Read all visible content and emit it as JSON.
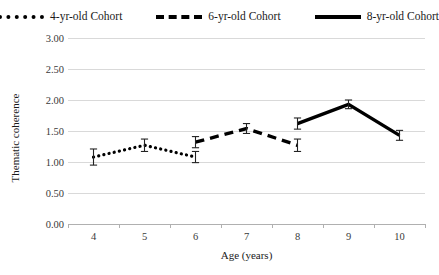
{
  "legend": {
    "entries": [
      {
        "label": "4-yr-old Cohort",
        "style": "dotted",
        "color": "#000000"
      },
      {
        "label": "6-yr-old Cohort",
        "style": "dashed",
        "color": "#000000"
      },
      {
        "label": "8-yr-old Cohort",
        "style": "solid",
        "color": "#000000"
      }
    ]
  },
  "chart_data": {
    "type": "line",
    "title": "",
    "xlabel": "Age (years)",
    "ylabel": "Thematic coherence",
    "x": [
      4,
      5,
      6,
      7,
      8,
      9,
      10
    ],
    "xtick_labels": [
      "4",
      "5",
      "6",
      "7",
      "8",
      "9",
      "10"
    ],
    "ytick_labels": [
      "0.00",
      "0.50",
      "1.00",
      "1.50",
      "2.00",
      "2.50",
      "3.00"
    ],
    "ytick_values": [
      0.0,
      0.5,
      1.0,
      1.5,
      2.0,
      2.5,
      3.0
    ],
    "ylim": [
      0.0,
      3.0
    ],
    "grid": true,
    "legend_position": "top",
    "error_bars": true,
    "series": [
      {
        "name": "4-yr-old Cohort",
        "style": "dotted",
        "color": "#000000",
        "x": [
          4,
          5,
          6
        ],
        "values": [
          1.08,
          1.27,
          1.08
        ],
        "errors": [
          0.13,
          0.1,
          0.09
        ]
      },
      {
        "name": "6-yr-old Cohort",
        "style": "dashed",
        "color": "#000000",
        "x": [
          6,
          7,
          8
        ],
        "values": [
          1.32,
          1.54,
          1.27
        ],
        "errors": [
          0.09,
          0.08,
          0.1
        ]
      },
      {
        "name": "8-yr-old Cohort",
        "style": "solid",
        "color": "#000000",
        "x": [
          8,
          9,
          10
        ],
        "values": [
          1.62,
          1.93,
          1.43
        ],
        "errors": [
          0.09,
          0.07,
          0.08
        ]
      }
    ]
  }
}
